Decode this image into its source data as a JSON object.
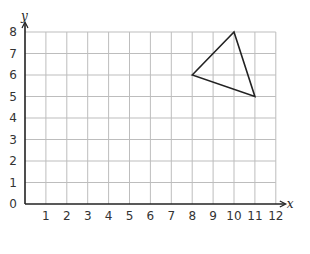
{
  "chart_data": {
    "type": "scatter",
    "title": "",
    "xlabel": "x",
    "ylabel": "y",
    "xlim": [
      0,
      12
    ],
    "ylim": [
      0,
      8
    ],
    "grid": true,
    "x_ticks": [
      0,
      1,
      2,
      3,
      4,
      5,
      6,
      7,
      8,
      9,
      10,
      11,
      12
    ],
    "y_ticks": [
      0,
      1,
      2,
      3,
      4,
      5,
      6,
      7,
      8
    ],
    "shapes": [
      {
        "name": "triangle",
        "type": "polygon",
        "vertices": [
          [
            8,
            6
          ],
          [
            10,
            8
          ],
          [
            11,
            5
          ]
        ]
      }
    ],
    "legend": null
  },
  "colors": {
    "grid": "#bdbdbd",
    "axis": "#222222",
    "shape": "#222222",
    "text": "#333333"
  },
  "labels": {
    "x_axis": "x",
    "y_axis": "y",
    "origin": "0"
  }
}
